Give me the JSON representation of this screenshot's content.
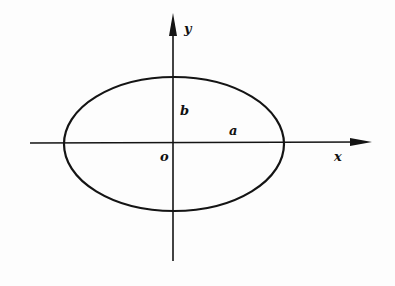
{
  "diagram": {
    "type": "ellipse-on-coordinate-axes",
    "labels": {
      "y_axis": "y",
      "x_axis": "x",
      "origin": "o",
      "semi_minor": "b",
      "semi_major": "a"
    },
    "geometry": {
      "center": [
        173,
        143
      ],
      "rx": 110,
      "ry": 67,
      "x_axis_from": 30,
      "x_axis_to": 372,
      "y_axis_from": 14,
      "y_axis_to": 261
    },
    "colors": {
      "stroke": "#141414",
      "background": "#fdfdfd"
    }
  }
}
